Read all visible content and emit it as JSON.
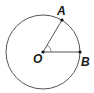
{
  "diagram": {
    "type": "circle-geometry",
    "circle": {
      "center": "O",
      "cx": 43,
      "cy": 52,
      "r": 37
    },
    "points": [
      {
        "label": "O",
        "x": 43,
        "y": 52
      },
      {
        "label": "A",
        "x": 62,
        "y": 20
      },
      {
        "label": "B",
        "x": 80,
        "y": 52
      }
    ],
    "segments": [
      [
        "O",
        "A"
      ],
      [
        "O",
        "B"
      ]
    ],
    "angle_marker": {
      "vertex": "O",
      "between": [
        "A",
        "B"
      ]
    },
    "labels": {
      "O": "O",
      "A": "A",
      "B": "B"
    },
    "stroke_color": "#555555",
    "point_color": "#111111"
  }
}
